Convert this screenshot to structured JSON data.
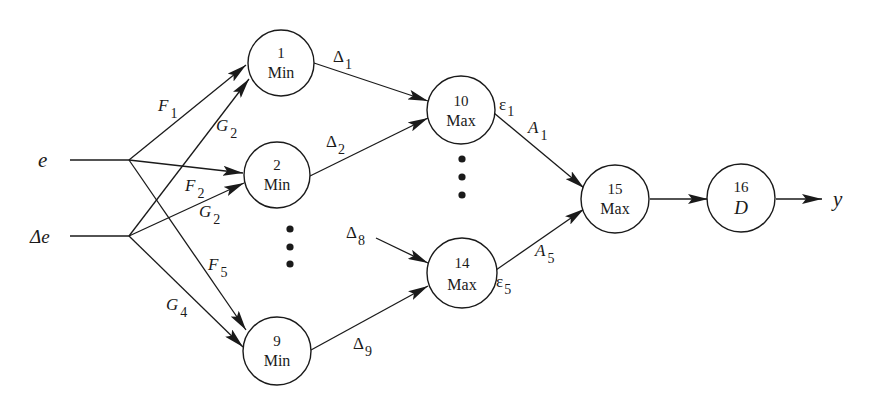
{
  "diagram": {
    "inputs": [
      {
        "id": "e",
        "label": "e"
      },
      {
        "id": "de",
        "label": "Δe"
      }
    ],
    "output": {
      "label": "y"
    },
    "nodes": [
      {
        "id": "1",
        "number": "1",
        "op": "Min"
      },
      {
        "id": "2",
        "number": "2",
        "op": "Min"
      },
      {
        "id": "9",
        "number": "9",
        "op": "Min"
      },
      {
        "id": "10",
        "number": "10",
        "op": "Max"
      },
      {
        "id": "14",
        "number": "14",
        "op": "Max"
      },
      {
        "id": "15",
        "number": "15",
        "op": "Max"
      },
      {
        "id": "16",
        "number": "16",
        "op": "D"
      }
    ],
    "edge_labels": {
      "F1": {
        "base": "F",
        "sub": "1"
      },
      "G2a": {
        "base": "G",
        "sub": "2"
      },
      "F2": {
        "base": "F",
        "sub": "2"
      },
      "G2b": {
        "base": "G",
        "sub": "2"
      },
      "F5": {
        "base": "F",
        "sub": "5"
      },
      "G4": {
        "base": "G",
        "sub": "4"
      },
      "D1": {
        "base": "Δ",
        "sub": "1"
      },
      "D2": {
        "base": "Δ",
        "sub": "2"
      },
      "D8": {
        "base": "Δ",
        "sub": "8"
      },
      "D9": {
        "base": "Δ",
        "sub": "9"
      },
      "E1": {
        "base": "ε",
        "sub": "1"
      },
      "E5": {
        "base": "ε",
        "sub": "5"
      },
      "A1": {
        "base": "A",
        "sub": "1"
      },
      "A5": {
        "base": "A",
        "sub": "5"
      }
    },
    "edges": [
      {
        "from": "e",
        "to": "1",
        "label": "F1"
      },
      {
        "from": "e",
        "to": "2",
        "label": "F2"
      },
      {
        "from": "e",
        "to": "9",
        "label": "F5"
      },
      {
        "from": "de",
        "to": "1",
        "label": "G2"
      },
      {
        "from": "de",
        "to": "2",
        "label": "G2"
      },
      {
        "from": "de",
        "to": "9",
        "label": "G4"
      },
      {
        "from": "1",
        "to": "10",
        "label": "Δ1"
      },
      {
        "from": "2",
        "to": "10",
        "label": "Δ2"
      },
      {
        "from": "Δ8",
        "to": "14",
        "label": "Δ8"
      },
      {
        "from": "9",
        "to": "14",
        "label": "Δ9"
      },
      {
        "from": "10",
        "to": "15",
        "label": "A1",
        "tail_label": "ε1"
      },
      {
        "from": "14",
        "to": "15",
        "label": "A5",
        "tail_label": "ε5"
      },
      {
        "from": "15",
        "to": "16"
      },
      {
        "from": "16",
        "to": "y"
      }
    ],
    "ellipses": [
      "min-column-ellipsis",
      "max-column-ellipsis"
    ]
  }
}
